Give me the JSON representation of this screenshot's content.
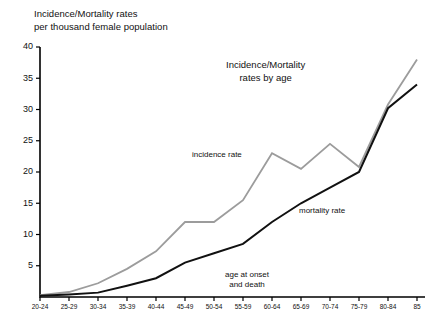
{
  "axis_title": "Incidence/Mortality rates\nper thousand female population",
  "notes": {
    "title_note": "Incidence/Mortality\nrates by age",
    "incidence_label": "incidence rate",
    "mortality_label": "mortality rate",
    "onset_label": "age at onset\nand death"
  },
  "colors": {
    "incidence": "#9c9c9c",
    "mortality": "#111111",
    "axis": "#000000",
    "background": "#ffffff",
    "text": "#111111"
  },
  "chart_data": {
    "type": "line",
    "title": "Incidence/Mortality rates by age",
    "xlabel": "age at onset and death",
    "ylabel": "Incidence/Mortality rates per thousand female population",
    "ylim": [
      0,
      40
    ],
    "yticks": [
      0,
      5,
      10,
      15,
      20,
      25,
      30,
      35,
      40
    ],
    "ytick_labels": [
      "",
      "5",
      "10",
      "15",
      "20",
      "25",
      "30",
      "35",
      "40"
    ],
    "grid": false,
    "legend": "inline-annotations",
    "categories": [
      "20-24",
      "25-29",
      "30-34",
      "35-39",
      "40-44",
      "45-49",
      "50-54",
      "55-59",
      "60-64",
      "65-69",
      "70-74",
      "75-79",
      "80-84",
      "85"
    ],
    "series": [
      {
        "name": "incidence rate",
        "color": "#9c9c9c",
        "values": [
          0.3,
          0.8,
          2.2,
          4.5,
          7.3,
          12.0,
          12.0,
          15.5,
          23.0,
          20.5,
          24.5,
          20.8,
          30.8,
          38.0
        ]
      },
      {
        "name": "mortality rate",
        "color": "#111111",
        "values": [
          0.2,
          0.4,
          0.7,
          1.8,
          3.0,
          5.5,
          7.0,
          8.5,
          12.0,
          15.0,
          17.5,
          20.0,
          30.2,
          34.0
        ]
      }
    ]
  }
}
